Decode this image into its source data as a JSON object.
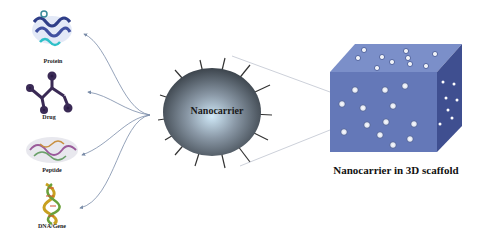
{
  "diagram": {
    "molecules": [
      {
        "label": "Protein",
        "icon": "protein-ribbon-icon"
      },
      {
        "label": "Drug",
        "icon": "drug-molecule-icon"
      },
      {
        "label": "Peptide",
        "icon": "peptide-structure-icon"
      },
      {
        "label": "DNA/Gene",
        "icon": "dna-helix-icon"
      }
    ],
    "center": {
      "label": "Nanocarrier"
    },
    "scaffold": {
      "label": "Nanocarrier in 3D scaffold"
    },
    "colors": {
      "sphere": "#4a5560",
      "cube_front": "#6478b8",
      "cube_side": "#3f4f90",
      "cube_top": "#7b8fc9",
      "arrow": "#7a8ca8"
    }
  }
}
